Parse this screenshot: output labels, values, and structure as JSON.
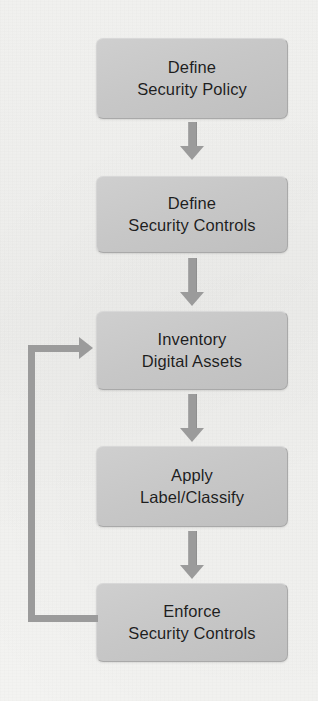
{
  "diagram": {
    "type": "flowchart",
    "background_color": "#f3f3f1",
    "node_fill_color": "#c8c8c8",
    "node_border_color": "#a9a9a9",
    "arrow_color": "#9b9b9b",
    "text_color": "#1e1e1e",
    "nodes": [
      {
        "id": "define-security-policy",
        "line1": "Define",
        "line2": "Security Policy"
      },
      {
        "id": "define-security-controls",
        "line1": "Define",
        "line2": "Security Controls"
      },
      {
        "id": "inventory-digital-assets",
        "line1": "Inventory",
        "line2": "Digital Assets"
      },
      {
        "id": "apply-label-classify",
        "line1": "Apply",
        "line2": "Label/Classify"
      },
      {
        "id": "enforce-security-controls",
        "line1": "Enforce",
        "line2": "Security Controls"
      }
    ],
    "connectors": [
      {
        "id": "arrow-policy-to-controls",
        "from": "define-security-policy",
        "to": "define-security-controls",
        "kind": "arrow-down"
      },
      {
        "id": "arrow-controls-to-inventory",
        "from": "define-security-controls",
        "to": "inventory-digital-assets",
        "kind": "arrow-down"
      },
      {
        "id": "arrow-inventory-to-apply",
        "from": "inventory-digital-assets",
        "to": "apply-label-classify",
        "kind": "arrow-down"
      },
      {
        "id": "arrow-apply-to-enforce",
        "from": "apply-label-classify",
        "to": "enforce-security-controls",
        "kind": "arrow-down"
      },
      {
        "id": "feedback-loop-enforce-to-inventory",
        "from": "enforce-security-controls",
        "to": "inventory-digital-assets",
        "kind": "feedback-loop-left"
      }
    ]
  }
}
